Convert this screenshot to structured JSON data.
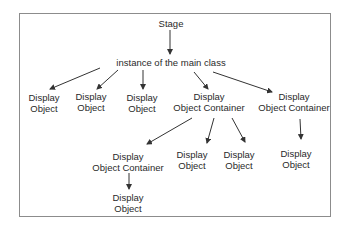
{
  "diagram": {
    "type": "tree",
    "colors": {
      "border": "#8c8c8c",
      "line": "#333333",
      "text": "#2a2a2a",
      "background": "#ffffff"
    },
    "nodes": [
      {
        "id": "stage",
        "lines": [
          "Stage"
        ],
        "x": 171,
        "y": 18
      },
      {
        "id": "main",
        "lines": [
          "instance of the main class"
        ],
        "x": 171,
        "y": 57
      },
      {
        "id": "do1",
        "lines": [
          "Display",
          "Object"
        ],
        "x": 44,
        "y": 92
      },
      {
        "id": "do2",
        "lines": [
          "Display",
          "Object"
        ],
        "x": 91,
        "y": 91
      },
      {
        "id": "do3",
        "lines": [
          "Display",
          "Object"
        ],
        "x": 142,
        "y": 92
      },
      {
        "id": "doc1",
        "lines": [
          "Display",
          "Object Container"
        ],
        "x": 209,
        "y": 91
      },
      {
        "id": "doc2",
        "lines": [
          "Display",
          "Object Container"
        ],
        "x": 294,
        "y": 91
      },
      {
        "id": "doc3",
        "lines": [
          "Display",
          "Object Container"
        ],
        "x": 128,
        "y": 151
      },
      {
        "id": "do4",
        "lines": [
          "Display",
          "Object"
        ],
        "x": 192,
        "y": 149
      },
      {
        "id": "do5",
        "lines": [
          "Display",
          "Object"
        ],
        "x": 239,
        "y": 149
      },
      {
        "id": "do6",
        "lines": [
          "Display",
          "Object"
        ],
        "x": 296,
        "y": 148
      },
      {
        "id": "do7",
        "lines": [
          "Display",
          "Object"
        ],
        "x": 128,
        "y": 192
      }
    ],
    "edges": [
      {
        "from": "stage",
        "to": "main",
        "x1": 170,
        "y1": 30,
        "x2": 170,
        "y2": 54
      },
      {
        "from": "main",
        "to": "do1",
        "x1": 100,
        "y1": 68,
        "x2": 50,
        "y2": 89
      },
      {
        "from": "main",
        "to": "do2",
        "x1": 118,
        "y1": 70,
        "x2": 97,
        "y2": 89
      },
      {
        "from": "main",
        "to": "do3",
        "x1": 143,
        "y1": 70,
        "x2": 143,
        "y2": 89
      },
      {
        "from": "main",
        "to": "doc1",
        "x1": 194,
        "y1": 72,
        "x2": 208,
        "y2": 89
      },
      {
        "from": "main",
        "to": "doc2",
        "x1": 213,
        "y1": 72,
        "x2": 272,
        "y2": 92
      },
      {
        "from": "doc1",
        "to": "doc3",
        "x1": 192,
        "y1": 118,
        "x2": 147,
        "y2": 144
      },
      {
        "from": "doc1",
        "to": "do4",
        "x1": 214,
        "y1": 118,
        "x2": 207,
        "y2": 143
      },
      {
        "from": "doc1",
        "to": "do5",
        "x1": 232,
        "y1": 118,
        "x2": 245,
        "y2": 142
      },
      {
        "from": "doc2",
        "to": "do6",
        "x1": 300,
        "y1": 119,
        "x2": 301,
        "y2": 139
      },
      {
        "from": "doc3",
        "to": "do7",
        "x1": 129,
        "y1": 173,
        "x2": 129,
        "y2": 189
      }
    ]
  }
}
